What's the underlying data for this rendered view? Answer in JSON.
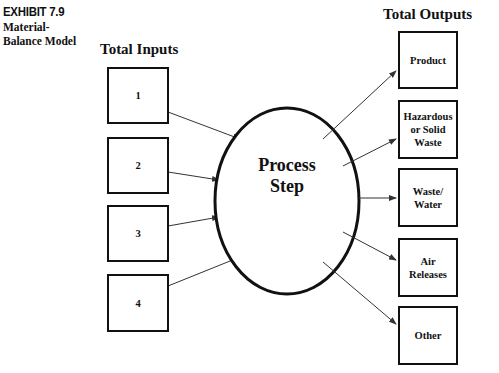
{
  "exhibit": {
    "number": "EXHIBIT 7.9",
    "title_line1": "Material-",
    "title_line2": "Balance Model"
  },
  "inputs": {
    "heading": "Total Inputs",
    "items": [
      {
        "label": "1"
      },
      {
        "label": "2"
      },
      {
        "label": "3"
      },
      {
        "label": "4"
      }
    ]
  },
  "process": {
    "line1": "Process",
    "line2": "Step"
  },
  "outputs": {
    "heading": "Total Outputs",
    "items": [
      {
        "label": "Product"
      },
      {
        "label": "Hazardous or Solid Waste"
      },
      {
        "label": "Waste/ Water"
      },
      {
        "label": "Air Releases"
      },
      {
        "label": "Other"
      }
    ]
  },
  "colors": {
    "stroke": "#111111",
    "arrow": "#333333",
    "background": "#ffffff"
  }
}
